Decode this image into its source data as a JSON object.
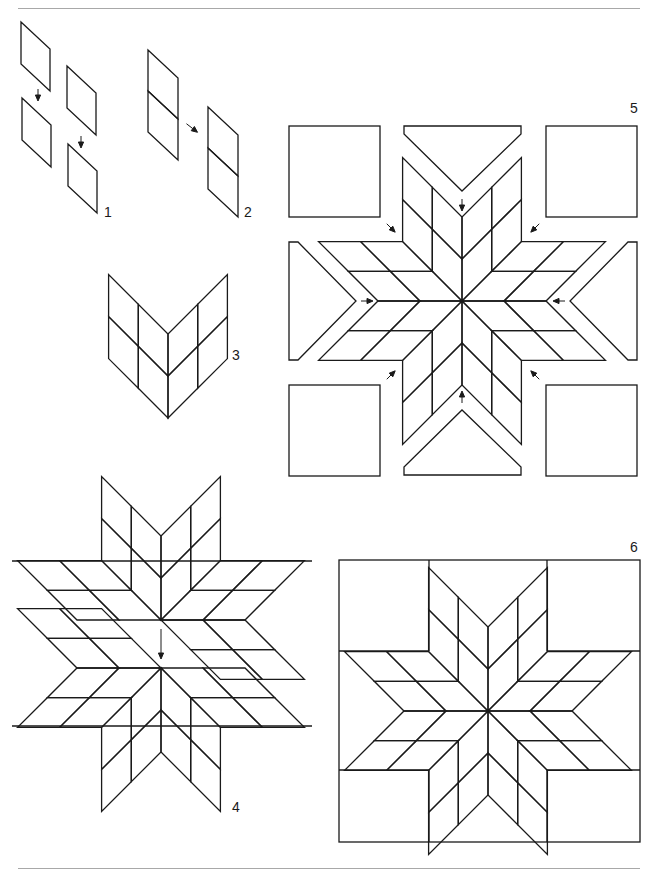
{
  "page": {
    "width": 655,
    "height": 874,
    "background": "#ffffff",
    "line_color": "#1a1a1a",
    "rule_color": "#a8a8a8",
    "top_rule_y": 8,
    "bottom_rule_y": 868
  },
  "steps": [
    {
      "id": 1,
      "label": "1",
      "x": 104,
      "y": 205,
      "caption": "Pairs of diamonds joined"
    },
    {
      "id": 2,
      "label": "2",
      "x": 244,
      "y": 205,
      "caption": "Two-diamond strips joined"
    },
    {
      "id": 3,
      "label": "3",
      "x": 232,
      "y": 348,
      "caption": "Two star points joined"
    },
    {
      "id": 4,
      "label": "4",
      "x": 232,
      "y": 802,
      "caption": "Star halves joined"
    },
    {
      "id": 5,
      "label": "5",
      "x": 630,
      "y": 101,
      "caption": "Corner squares and side triangles set in"
    },
    {
      "id": 6,
      "label": "6",
      "x": 630,
      "y": 540,
      "caption": "Completed block"
    }
  ],
  "figures": {
    "fig5": {
      "cx": 462,
      "cy": 301,
      "unit": 42
    },
    "fig6": {
      "cx": 488,
      "cy": 711,
      "unit": 42,
      "box": [
        339,
        560,
        640,
        842
      ]
    }
  }
}
